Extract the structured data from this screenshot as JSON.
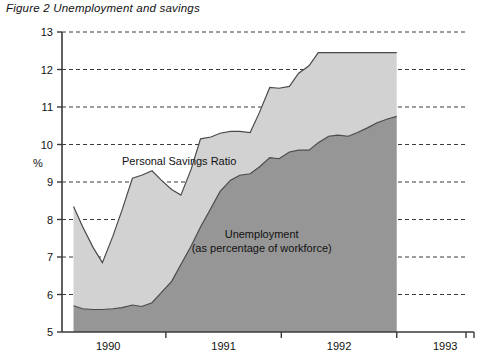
{
  "figure": {
    "title": "Figure 2  Unemployment and savings"
  },
  "chart_data": {
    "type": "area",
    "title": "Figure 2  Unemployment and savings",
    "xlabel": "",
    "ylabel": "%",
    "ylim": [
      5,
      13
    ],
    "xlim": [
      1989.6,
      1993.1
    ],
    "yticks": [
      5,
      6,
      7,
      8,
      9,
      10,
      11,
      12,
      13
    ],
    "ytick_labels": [
      "5",
      "6",
      "7",
      "8",
      "9",
      "10",
      "11",
      "12",
      "13"
    ],
    "xticks": [
      1990,
      1991,
      1992,
      1993
    ],
    "xtick_labels": [
      "1990",
      "1991",
      "1992",
      "1993"
    ],
    "grid": true,
    "grid_axis": "y",
    "legend_position": "inline-annotation",
    "colors": {
      "savings_fill": "#d2d2d2",
      "unemployment_fill": "#969696",
      "outline": "#4a4a4a",
      "axis": "#3a3a3a",
      "background": "#ffffff"
    },
    "annotations": [
      {
        "name": "savings-label",
        "text": "Personal Savings Ratio",
        "x": 1990.12,
        "y": 9.55
      },
      {
        "name": "unemployment-label-line1",
        "text": "Unemployment",
        "x": 1991.33,
        "y": 7.62
      },
      {
        "name": "unemployment-label-line2",
        "text": "(as percentage of workforce)",
        "x": 1991.33,
        "y": 7.25
      }
    ],
    "x": [
      1989.7,
      1989.78,
      1989.87,
      1989.95,
      1990.04,
      1990.12,
      1990.21,
      1990.29,
      1990.38,
      1990.46,
      1990.55,
      1990.63,
      1990.72,
      1990.8,
      1990.89,
      1990.97,
      1991.06,
      1991.14,
      1991.23,
      1991.31,
      1991.4,
      1991.48,
      1991.57,
      1991.65,
      1991.74,
      1991.82,
      1991.91,
      1991.99,
      1992.08,
      1992.16,
      1992.25,
      1992.33,
      1992.42,
      1992.5
    ],
    "series": [
      {
        "name": "Personal Savings Ratio",
        "stacking": "overlay-upper",
        "values": [
          8.35,
          7.8,
          7.25,
          6.85,
          7.55,
          8.25,
          9.1,
          9.18,
          9.3,
          9.05,
          8.8,
          8.65,
          9.35,
          10.15,
          10.2,
          10.3,
          10.35,
          10.35,
          10.32,
          10.85,
          11.52,
          11.5,
          11.55,
          11.9,
          12.1,
          12.45,
          12.45,
          12.45,
          12.45,
          12.45,
          12.45,
          12.45,
          12.45,
          12.45
        ]
      },
      {
        "name": "Unemployment (as percentage of workforce)",
        "stacking": "overlay-lower",
        "values": [
          5.7,
          5.62,
          5.6,
          5.6,
          5.62,
          5.65,
          5.72,
          5.68,
          5.78,
          6.05,
          6.35,
          6.8,
          7.3,
          7.8,
          8.3,
          8.75,
          9.05,
          9.18,
          9.22,
          9.4,
          9.65,
          9.62,
          9.8,
          9.85,
          9.85,
          10.05,
          10.22,
          10.25,
          10.22,
          10.32,
          10.45,
          10.58,
          10.68,
          10.75
        ]
      }
    ]
  }
}
